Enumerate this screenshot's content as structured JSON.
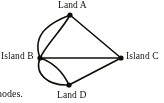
{
  "figure": {
    "type": "multigraph-diagram",
    "background_color": "#fdfdfb",
    "ink_color": "#15130f"
  },
  "nodes": [
    {
      "id": "A",
      "label": "Land A",
      "x": 70,
      "y": 15,
      "label_anchor": "above"
    },
    {
      "id": "B",
      "label": "Island B",
      "x": 40,
      "y": 58,
      "label_anchor": "left"
    },
    {
      "id": "C",
      "label": "Island C",
      "x": 121,
      "y": 58,
      "label_anchor": "right"
    },
    {
      "id": "D",
      "label": "Land D",
      "x": 69,
      "y": 85,
      "label_anchor": "below"
    }
  ],
  "edges": [
    {
      "from": "A",
      "to": "B",
      "style": "curved",
      "bow": "outer"
    },
    {
      "from": "A",
      "to": "B",
      "style": "curved",
      "bow": "inner"
    },
    {
      "from": "B",
      "to": "D",
      "style": "curved",
      "bow": "outer"
    },
    {
      "from": "B",
      "to": "D",
      "style": "curved",
      "bow": "inner"
    },
    {
      "from": "A",
      "to": "C",
      "style": "straight"
    },
    {
      "from": "B",
      "to": "C",
      "style": "straight"
    },
    {
      "from": "D",
      "to": "C",
      "style": "straight"
    }
  ],
  "caption": {
    "fragment": "nodes."
  }
}
